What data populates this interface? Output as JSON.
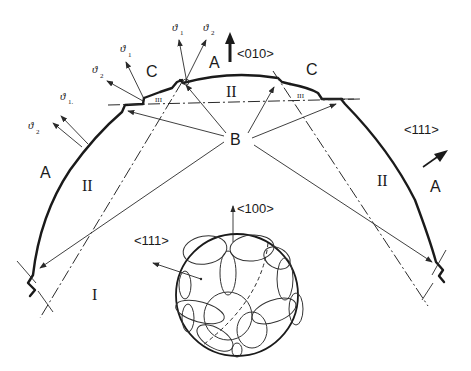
{
  "figure": {
    "labels": {
      "dir_010": "<010>",
      "dir_111_right": "<111>",
      "dir_111_inset": "<111>",
      "dir_100_inset": "<100>",
      "region_A_left": "A",
      "region_A_top": "A",
      "region_A_right": "A",
      "region_B": "B",
      "region_C_left": "C",
      "region_C_right": "C",
      "sector_I": "I",
      "sector_II_left": "II",
      "sector_II_center": "II",
      "sector_II_right": "II",
      "sector_III_left": "III",
      "sector_III_right": "III"
    },
    "vectors": {
      "left_pair": [
        {
          "symbol": "ϑ",
          "sub": "2"
        },
        {
          "symbol": "ϑ",
          "sub": "1."
        }
      ],
      "left_step_pair": [
        {
          "symbol": "ϑ",
          "sub": "2"
        },
        {
          "symbol": "ϑ",
          "sub": "1"
        }
      ],
      "top_pair": [
        {
          "symbol": "ϑ",
          "sub": "1"
        },
        {
          "symbol": "ϑ",
          "sub": "2"
        }
      ]
    },
    "colors": {
      "ink": "#1a1a1a",
      "background": "#ffffff"
    }
  }
}
